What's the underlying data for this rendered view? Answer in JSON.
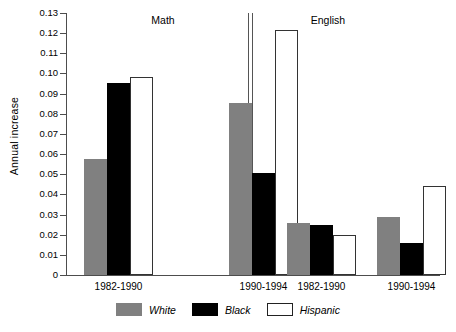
{
  "chart_data": {
    "type": "bar",
    "title": "",
    "xlabel": "",
    "ylabel": "Annual increase",
    "ylim": [
      0,
      0.13
    ],
    "ytick_step": 0.01,
    "grid": false,
    "legend_position": "bottom-center",
    "panels": [
      {
        "name": "Math",
        "categories": [
          "1982-1990",
          "1990-1994"
        ],
        "series": [
          {
            "name": "White",
            "values": [
              0.0575,
              0.0855
            ]
          },
          {
            "name": "Black",
            "values": [
              0.0955,
              0.0505
            ]
          },
          {
            "name": "Hispanic",
            "values": [
              0.098,
              0.1215
            ]
          }
        ]
      },
      {
        "name": "English",
        "categories": [
          "1982-1990",
          "1990-1994"
        ],
        "series": [
          {
            "name": "White",
            "values": [
              0.0258,
              0.0287
            ]
          },
          {
            "name": "Black",
            "values": [
              0.0248,
              0.0158
            ]
          },
          {
            "name": "Hispanic",
            "values": [
              0.02,
              0.044
            ]
          }
        ]
      }
    ],
    "ytick_labels": [
      "0.13",
      "0.12",
      "0.11",
      "0.10",
      "0.09",
      "0.08",
      "0.07",
      "0.06",
      "0.05",
      "0.04",
      "0.03",
      "0.02",
      "0.01",
      "0"
    ],
    "legend": [
      {
        "label": "White",
        "color": "#808080"
      },
      {
        "label": "Black",
        "color": "#000000"
      },
      {
        "label": "Hispanic",
        "color": "#ffffff"
      }
    ]
  },
  "colors": {
    "white_series": "#808080",
    "black_series": "#000000",
    "hispanic_series": "#ffffff",
    "axis": "#4d4d4d",
    "background": "#ffffff"
  }
}
